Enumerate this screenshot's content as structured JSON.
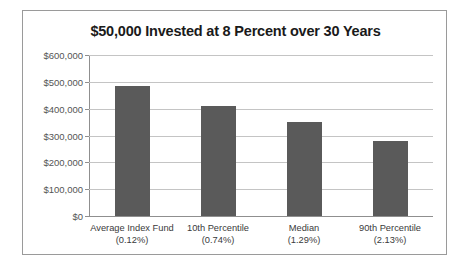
{
  "chart_data": {
    "type": "bar",
    "title": "$50,000 Invested at 8 Percent over 30 Years",
    "xlabel": "",
    "ylabel": "",
    "categories": [
      "Average Index Fund",
      "10th Percentile",
      "Median",
      "90th Percentile"
    ],
    "category_sublabels": [
      "(0.12%)",
      "(0.74%)",
      "(1.29%)",
      "(2.13%)"
    ],
    "values": [
      485000,
      410000,
      350000,
      280000
    ],
    "ylim": [
      0,
      600000
    ],
    "ytick_values": [
      0,
      100000,
      200000,
      300000,
      400000,
      500000,
      600000
    ],
    "ytick_labels": [
      "$0",
      "$100,000",
      "$200,000",
      "$300,000",
      "$400,000",
      "$500,000",
      "$600,000"
    ],
    "grid": true,
    "legend": false,
    "bar_color": "#5a5a5a",
    "gridline_color": "#c4c4c4",
    "axis_color": "#8f8f8f",
    "border_color": "#9a9a9a",
    "background_color": "#ffffff",
    "title_color": "#1a1a1a",
    "tick_label_color": "#555555",
    "category_label_color": "#3a3a3a"
  }
}
